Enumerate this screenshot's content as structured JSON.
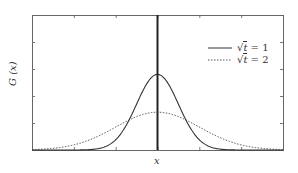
{
  "chart_data": {
    "type": "line",
    "title": "",
    "xlabel": "x",
    "ylabel": "G (x)",
    "xlim": [
      -3,
      3
    ],
    "ylim": [
      0,
      0.5
    ],
    "grid": false,
    "legend_position": "upper right",
    "x_ticks_labeled": false,
    "y_ticks_labeled": false,
    "annotations": [
      "vertical line at x = 0"
    ],
    "series": [
      {
        "name": "√t = 1",
        "style": "solid",
        "description": "Gaussian centered at 0, narrow",
        "x": [
          -3,
          -2,
          -1.5,
          -1,
          -0.5,
          0,
          0.5,
          1,
          1.5,
          2,
          3
        ],
        "values": [
          0.0,
          0.01,
          0.05,
          0.12,
          0.22,
          0.28,
          0.22,
          0.12,
          0.05,
          0.01,
          0.0
        ]
      },
      {
        "name": "√t = 2",
        "style": "dotted",
        "description": "Gaussian centered at 0, wide (half peak height, double width)",
        "x": [
          -3,
          -2,
          -1.5,
          -1,
          -0.5,
          0,
          0.5,
          1,
          1.5,
          2,
          3
        ],
        "values": [
          0.01,
          0.04,
          0.07,
          0.1,
          0.13,
          0.14,
          0.13,
          0.1,
          0.07,
          0.04,
          0.01
        ]
      }
    ]
  },
  "labels": {
    "x": "x",
    "y_main": "G",
    "y_arg": "(x)"
  },
  "legend": [
    {
      "pre": "√",
      "var": "t",
      "rest": " = 1",
      "style": "solid"
    },
    {
      "pre": "√",
      "var": "t",
      "rest": " = 2",
      "style": "dotted"
    }
  ],
  "colors": {
    "axes": "#555555",
    "line": "#333333",
    "background": "#ffffff"
  }
}
